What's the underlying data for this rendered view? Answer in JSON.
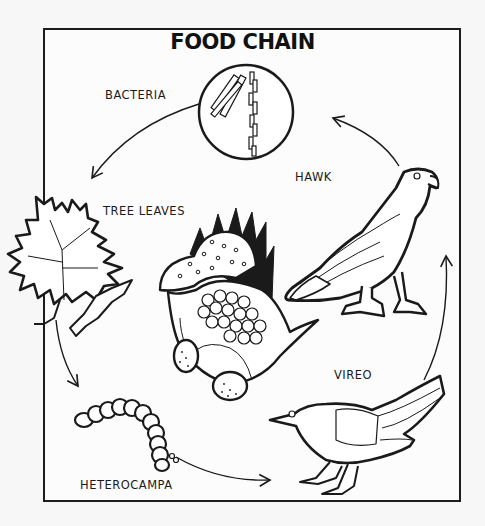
{
  "diagram": {
    "title": "FOOD CHAIN",
    "organisms": [
      {
        "id": "bacteria",
        "label": "BACTERIA"
      },
      {
        "id": "tree-leaves",
        "label": "TREE LEAVES"
      },
      {
        "id": "heterocampa",
        "label": "HETEROCAMPA"
      },
      {
        "id": "vireo",
        "label": "VIREO"
      },
      {
        "id": "hawk",
        "label": "HAWK"
      }
    ],
    "flow": [
      {
        "from": "bacteria",
        "to": "tree-leaves"
      },
      {
        "from": "tree-leaves",
        "to": "heterocampa"
      },
      {
        "from": "heterocampa",
        "to": "vireo"
      },
      {
        "from": "vireo",
        "to": "hawk"
      },
      {
        "from": "hawk",
        "to": "bacteria"
      }
    ],
    "colors": {
      "ink": "#1a1a1a",
      "paper": "#fcfcfc"
    }
  }
}
